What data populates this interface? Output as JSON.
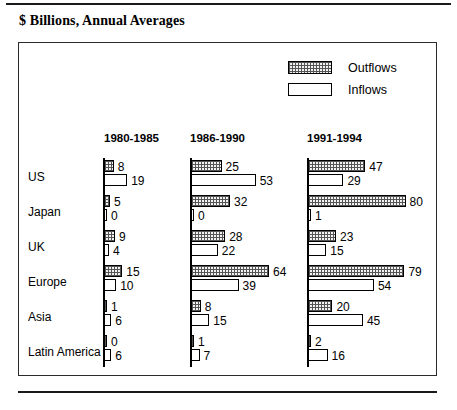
{
  "title": "$ Billions, Annual Averages",
  "legend": [
    {
      "key": "outflows",
      "label": "Outflows",
      "pattern": "stipple"
    },
    {
      "key": "inflows",
      "label": "Inflows",
      "pattern": "white"
    }
  ],
  "chart_data": {
    "type": "bar",
    "orientation": "horizontal",
    "title": "$ Billions, Annual Averages",
    "xlabel": "",
    "ylabel": "",
    "grid": false,
    "legend_position": "top-right",
    "categories": [
      "US",
      "Japan",
      "UK",
      "Europe",
      "Asia",
      "Latin America"
    ],
    "periods": [
      "1980-1985",
      "1986-1990",
      "1991-1994"
    ],
    "series": [
      {
        "name": "Outflows",
        "period": "1980-1985",
        "values": [
          8,
          5,
          9,
          15,
          1,
          0
        ]
      },
      {
        "name": "Inflows",
        "period": "1980-1985",
        "values": [
          19,
          0,
          4,
          10,
          6,
          6
        ]
      },
      {
        "name": "Outflows",
        "period": "1986-1990",
        "values": [
          25,
          32,
          28,
          64,
          8,
          1
        ]
      },
      {
        "name": "Inflows",
        "period": "1986-1990",
        "values": [
          53,
          0,
          22,
          39,
          15,
          7
        ]
      },
      {
        "name": "Outflows",
        "period": "1991-1994",
        "values": [
          47,
          80,
          23,
          79,
          20,
          2
        ]
      },
      {
        "name": "Inflows",
        "period": "1991-1994",
        "values": [
          29,
          1,
          15,
          54,
          45,
          16
        ]
      }
    ],
    "xlim": [
      0,
      80
    ],
    "units": "$ Billions"
  },
  "layout": {
    "baselines_x": [
      103,
      190,
      307
    ],
    "header_x": [
      104,
      190,
      307
    ],
    "row_top_y": [
      160,
      195,
      230,
      265,
      300,
      335
    ],
    "px_per_unit": 1.22,
    "label_x": 28
  }
}
